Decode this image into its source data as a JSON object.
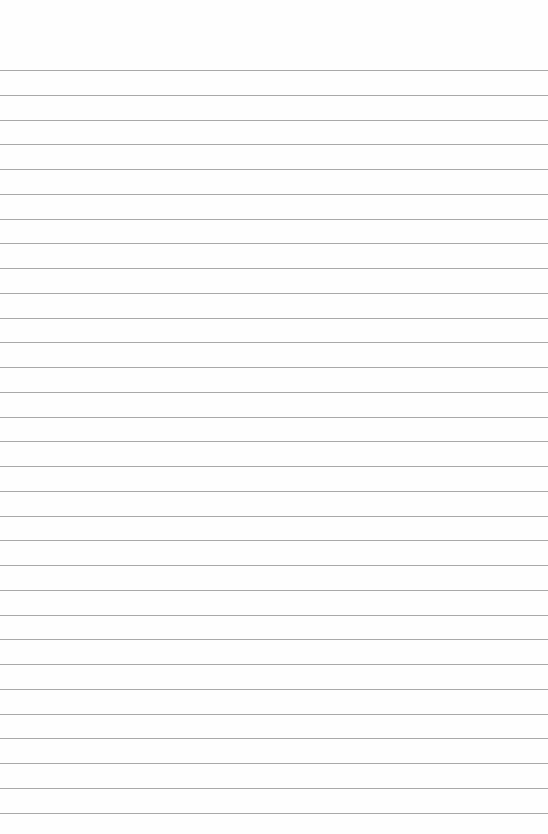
{
  "paper": {
    "kind": "blank lined paper",
    "line_count": 31,
    "line_color": "#9a9a9a",
    "background_color": "#fefefe"
  }
}
